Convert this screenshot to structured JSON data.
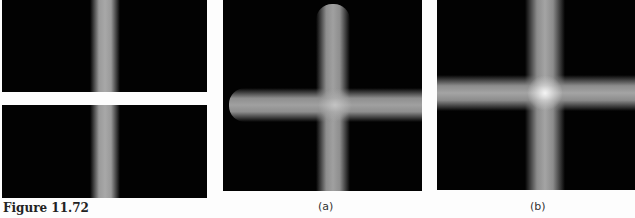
{
  "figure": {
    "caption": "Figure 11.72",
    "panels": [
      {
        "id": "left-top",
        "content": "vertical-gaussian-stripe"
      },
      {
        "id": "left-bottom",
        "content": "vertical-gaussian-stripe"
      },
      {
        "id": "a",
        "label": "(a)",
        "content": "cross-shaped blurred bars with rounded ends"
      },
      {
        "id": "b",
        "label": "(b)",
        "content": "cross-shaped blurred bars with bright center"
      }
    ]
  }
}
